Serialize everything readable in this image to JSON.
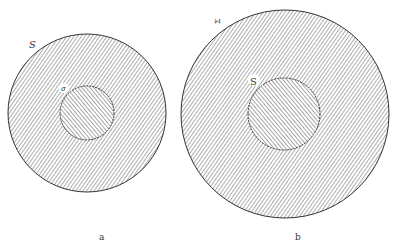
{
  "figure": {
    "panels": [
      {
        "id": "a",
        "caption": "a",
        "outer_label": "S",
        "inner_label": "σ",
        "outer": {
          "cx": 87,
          "cy": 113,
          "r": 79
        },
        "inner": {
          "cx": 87,
          "cy": 113,
          "r": 27
        }
      },
      {
        "id": "b",
        "caption": "b",
        "outer_label": "Σ",
        "inner_label": "S",
        "outer": {
          "cx": 285,
          "cy": 114,
          "r": 104
        },
        "inner": {
          "cx": 284,
          "cy": 114,
          "r": 36
        }
      }
    ],
    "colors": {
      "hatch": "#555555",
      "outline": "#333333",
      "background": "#ffffff"
    }
  }
}
